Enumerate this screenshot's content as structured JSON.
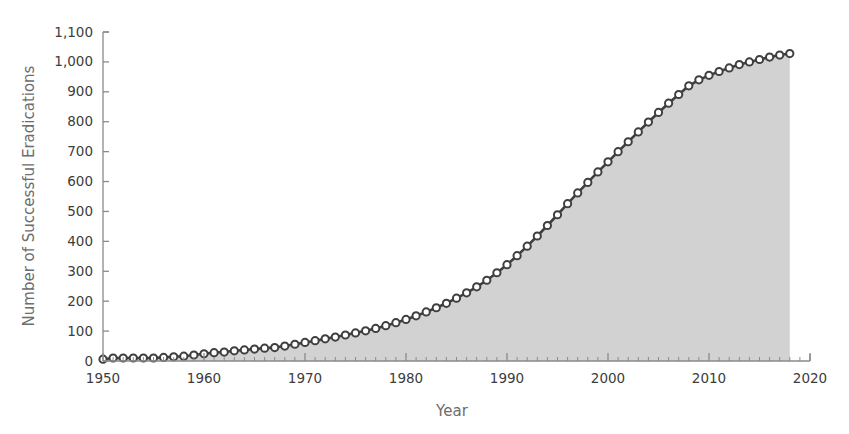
{
  "chart_data": {
    "type": "area",
    "title": "",
    "xlabel": "Year",
    "ylabel": "Number of Successful Eradications",
    "xlim": [
      1950,
      2020
    ],
    "ylim": [
      0,
      1100
    ],
    "xticks": [
      1950,
      1960,
      1970,
      1980,
      1990,
      2000,
      2010,
      2020
    ],
    "xtick_labels": [
      "1950",
      "1960",
      "1970",
      "1980",
      "1990",
      "2000",
      "2010",
      "2020"
    ],
    "x_minor_tick_interval": 1,
    "yticks": [
      0,
      100,
      200,
      300,
      400,
      500,
      600,
      700,
      800,
      900,
      1000,
      1100
    ],
    "ytick_labels": [
      "0",
      "100",
      "200",
      "300",
      "400",
      "500",
      "600",
      "700",
      "800",
      "900",
      "1,000",
      "1,100"
    ],
    "grid": false,
    "legend": "none",
    "marker": "open-circle",
    "series": [
      {
        "name": "Cumulative successful eradications",
        "x": [
          1950,
          1951,
          1952,
          1953,
          1954,
          1955,
          1956,
          1957,
          1958,
          1959,
          1960,
          1961,
          1962,
          1963,
          1964,
          1965,
          1966,
          1967,
          1968,
          1969,
          1970,
          1971,
          1972,
          1973,
          1974,
          1975,
          1976,
          1977,
          1978,
          1979,
          1980,
          1981,
          1982,
          1983,
          1984,
          1985,
          1986,
          1987,
          1988,
          1989,
          1990,
          1991,
          1992,
          1993,
          1994,
          1995,
          1996,
          1997,
          1998,
          1999,
          2000,
          2001,
          2002,
          2003,
          2004,
          2005,
          2006,
          2007,
          2008,
          2009,
          2010,
          2011,
          2012,
          2013,
          2014,
          2015,
          2016,
          2017,
          2018
        ],
        "values": [
          6,
          10,
          10,
          10,
          10,
          10,
          12,
          14,
          16,
          20,
          24,
          28,
          30,
          34,
          37,
          40,
          43,
          45,
          50,
          56,
          62,
          68,
          74,
          80,
          87,
          94,
          101,
          109,
          118,
          128,
          139,
          151,
          164,
          178,
          193,
          210,
          228,
          248,
          270,
          295,
          322,
          352,
          384,
          418,
          453,
          489,
          526,
          562,
          597,
          632,
          666,
          700,
          733,
          766,
          799,
          831,
          862,
          891,
          920,
          940,
          955,
          968,
          980,
          991,
          1000,
          1008,
          1016,
          1023,
          1028
        ]
      }
    ],
    "colors": {
      "area_fill": "#d2d2d2",
      "line": "#3f3f3f",
      "marker_fill": "#ffffff",
      "marker_stroke": "#3f3f3f",
      "axis": "#8a8a8a",
      "tick_text": "#3d3d3d",
      "axis_title_text": "#6d6d6d"
    }
  }
}
